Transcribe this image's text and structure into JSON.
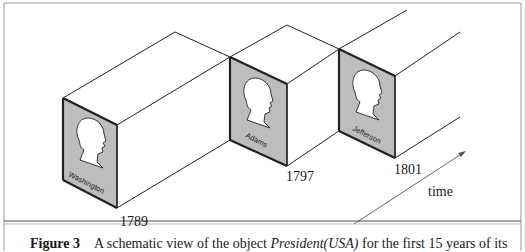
{
  "figure": {
    "panels": [
      {
        "id": "washington",
        "label": "Washington",
        "year": "1789"
      },
      {
        "id": "adams",
        "label": "Adams",
        "year": "1797"
      },
      {
        "id": "jefferson",
        "label": "Jefferson",
        "year": "1801"
      }
    ],
    "axis_label": "time",
    "colors": {
      "panel_fill": "#bdbdbd",
      "line": "#222222",
      "frame": "#888888",
      "head_fill": "#ffffff"
    }
  },
  "caption": {
    "figure_number": "Figure 3",
    "text_before": "A schematic view of the object ",
    "object_name": "President(USA)",
    "text_after": " for the first 15 years of its"
  }
}
